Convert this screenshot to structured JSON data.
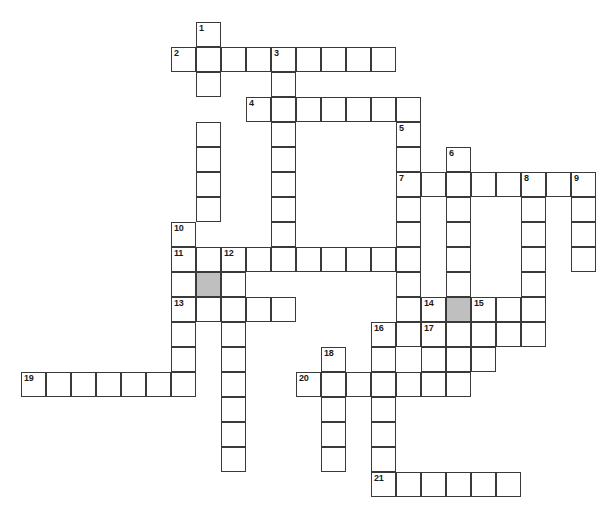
{
  "puzzle": {
    "kind": "crossword-grid",
    "title": "",
    "cell_size_px": 25,
    "grid_origin": {
      "x": 21,
      "y": 22
    },
    "canvas": {
      "width": 603,
      "height": 521
    },
    "colors": {
      "background": "#ffffff",
      "cell_fill": "#ffffff",
      "cell_border": "#3a3a3a",
      "shaded_fill": "#bfbfbf",
      "number_text": "#1a1a1a"
    },
    "counts": {
      "total_cells": 146,
      "numbered_cells": 21,
      "shaded_cells": 2
    },
    "entries": [
      {
        "number": "1",
        "direction": "down",
        "col": 7,
        "row": 0,
        "length": 7
      },
      {
        "number": "2",
        "direction": "across",
        "col": 6,
        "row": 1,
        "length": 9
      },
      {
        "number": "3",
        "direction": "down",
        "col": 10,
        "row": 1,
        "length": 9
      },
      {
        "number": "4",
        "direction": "across",
        "col": 9,
        "row": 3,
        "length": 7
      },
      {
        "number": "5",
        "direction": "down",
        "col": 15,
        "row": 4,
        "length": 8
      },
      {
        "number": "6",
        "direction": "down",
        "col": 17,
        "row": 5,
        "length": 10
      },
      {
        "number": "7",
        "direction": "across",
        "col": 15,
        "row": 6,
        "length": 8
      },
      {
        "number": "8",
        "direction": "down",
        "col": 20,
        "row": 6,
        "length": 7
      },
      {
        "number": "9",
        "direction": "down",
        "col": 22,
        "row": 6,
        "length": 5
      },
      {
        "number": "10",
        "direction": "down",
        "col": 6,
        "row": 8,
        "length": 8
      },
      {
        "number": "11",
        "direction": "across",
        "col": 6,
        "row": 9,
        "length": 10
      },
      {
        "number": "12",
        "direction": "down",
        "col": 8,
        "row": 9,
        "length": 9
      },
      {
        "number": "13",
        "direction": "across",
        "col": 6,
        "row": 11,
        "length": 5
      },
      {
        "number": "14",
        "direction": "across",
        "col": 16,
        "row": 11,
        "length": 5
      },
      {
        "number": "15",
        "direction": "down",
        "col": 18,
        "row": 11,
        "length": 4
      },
      {
        "number": "16",
        "direction": "down",
        "col": 14,
        "row": 12,
        "length": 8
      },
      {
        "number": "17",
        "direction": "across",
        "col": 16,
        "row": 12,
        "length": 5
      },
      {
        "number": "18",
        "direction": "down",
        "col": 12,
        "row": 13,
        "length": 7
      },
      {
        "number": "19",
        "direction": "across",
        "col": 0,
        "row": 14,
        "length": 7
      },
      {
        "number": "20",
        "direction": "across",
        "col": 11,
        "row": 14,
        "length": 7
      },
      {
        "number": "21",
        "direction": "across",
        "col": 14,
        "row": 18,
        "length": 6
      }
    ],
    "shaded_cells": [
      {
        "col": 7,
        "row": 10
      },
      {
        "col": 17,
        "row": 11
      }
    ],
    "cells": [
      {
        "col": 7,
        "row": 0,
        "num": "1"
      },
      {
        "col": 6,
        "row": 1,
        "num": "2"
      },
      {
        "col": 7,
        "row": 1,
        "num": ""
      },
      {
        "col": 8,
        "row": 1,
        "num": ""
      },
      {
        "col": 9,
        "row": 1,
        "num": ""
      },
      {
        "col": 10,
        "row": 1,
        "num": "3"
      },
      {
        "col": 11,
        "row": 1,
        "num": ""
      },
      {
        "col": 12,
        "row": 1,
        "num": ""
      },
      {
        "col": 13,
        "row": 1,
        "num": ""
      },
      {
        "col": 14,
        "row": 1,
        "num": ""
      },
      {
        "col": 7,
        "row": 2,
        "num": ""
      },
      {
        "col": 10,
        "row": 2,
        "num": ""
      },
      {
        "col": 9,
        "row": 3,
        "num": "4"
      },
      {
        "col": 10,
        "row": 3,
        "num": ""
      },
      {
        "col": 11,
        "row": 3,
        "num": ""
      },
      {
        "col": 12,
        "row": 3,
        "num": ""
      },
      {
        "col": 13,
        "row": 3,
        "num": ""
      },
      {
        "col": 14,
        "row": 3,
        "num": ""
      },
      {
        "col": 15,
        "row": 3,
        "num": ""
      },
      {
        "col": 7,
        "row": 4,
        "num": ""
      },
      {
        "col": 10,
        "row": 4,
        "num": ""
      },
      {
        "col": 15,
        "row": 4,
        "num": "5"
      },
      {
        "col": 7,
        "row": 5,
        "num": ""
      },
      {
        "col": 10,
        "row": 5,
        "num": ""
      },
      {
        "col": 15,
        "row": 5,
        "num": ""
      },
      {
        "col": 17,
        "row": 5,
        "num": "6"
      },
      {
        "col": 7,
        "row": 6,
        "num": ""
      },
      {
        "col": 10,
        "row": 6,
        "num": ""
      },
      {
        "col": 15,
        "row": 6,
        "num": "7"
      },
      {
        "col": 16,
        "row": 6,
        "num": ""
      },
      {
        "col": 17,
        "row": 6,
        "num": ""
      },
      {
        "col": 18,
        "row": 6,
        "num": ""
      },
      {
        "col": 19,
        "row": 6,
        "num": ""
      },
      {
        "col": 20,
        "row": 6,
        "num": "8"
      },
      {
        "col": 21,
        "row": 6,
        "num": ""
      },
      {
        "col": 22,
        "row": 6,
        "num": "9"
      },
      {
        "col": 7,
        "row": 7,
        "num": ""
      },
      {
        "col": 10,
        "row": 7,
        "num": ""
      },
      {
        "col": 15,
        "row": 7,
        "num": ""
      },
      {
        "col": 17,
        "row": 7,
        "num": ""
      },
      {
        "col": 20,
        "row": 7,
        "num": ""
      },
      {
        "col": 22,
        "row": 7,
        "num": ""
      },
      {
        "col": 6,
        "row": 8,
        "num": "10"
      },
      {
        "col": 10,
        "row": 8,
        "num": ""
      },
      {
        "col": 15,
        "row": 8,
        "num": ""
      },
      {
        "col": 17,
        "row": 8,
        "num": ""
      },
      {
        "col": 20,
        "row": 8,
        "num": ""
      },
      {
        "col": 22,
        "row": 8,
        "num": ""
      },
      {
        "col": 6,
        "row": 9,
        "num": "11"
      },
      {
        "col": 7,
        "row": 9,
        "num": ""
      },
      {
        "col": 8,
        "row": 9,
        "num": "12"
      },
      {
        "col": 9,
        "row": 9,
        "num": ""
      },
      {
        "col": 10,
        "row": 9,
        "num": ""
      },
      {
        "col": 11,
        "row": 9,
        "num": ""
      },
      {
        "col": 12,
        "row": 9,
        "num": ""
      },
      {
        "col": 13,
        "row": 9,
        "num": ""
      },
      {
        "col": 14,
        "row": 9,
        "num": ""
      },
      {
        "col": 15,
        "row": 9,
        "num": ""
      },
      {
        "col": 17,
        "row": 9,
        "num": ""
      },
      {
        "col": 20,
        "row": 9,
        "num": ""
      },
      {
        "col": 22,
        "row": 9,
        "num": ""
      },
      {
        "col": 6,
        "row": 10,
        "num": ""
      },
      {
        "col": 7,
        "row": 10,
        "num": ""
      },
      {
        "col": 8,
        "row": 10,
        "num": ""
      },
      {
        "col": 15,
        "row": 10,
        "num": ""
      },
      {
        "col": 17,
        "row": 10,
        "num": ""
      },
      {
        "col": 20,
        "row": 10,
        "num": ""
      },
      {
        "col": 6,
        "row": 11,
        "num": "13"
      },
      {
        "col": 7,
        "row": 11,
        "num": ""
      },
      {
        "col": 8,
        "row": 11,
        "num": ""
      },
      {
        "col": 9,
        "row": 11,
        "num": ""
      },
      {
        "col": 10,
        "row": 11,
        "num": ""
      },
      {
        "col": 15,
        "row": 11,
        "num": ""
      },
      {
        "col": 16,
        "row": 11,
        "num": "14"
      },
      {
        "col": 17,
        "row": 11,
        "num": ""
      },
      {
        "col": 18,
        "row": 11,
        "num": "15"
      },
      {
        "col": 19,
        "row": 11,
        "num": ""
      },
      {
        "col": 20,
        "row": 11,
        "num": ""
      },
      {
        "col": 6,
        "row": 12,
        "num": ""
      },
      {
        "col": 8,
        "row": 12,
        "num": ""
      },
      {
        "col": 14,
        "row": 12,
        "num": "16"
      },
      {
        "col": 15,
        "row": 12,
        "num": ""
      },
      {
        "col": 16,
        "row": 12,
        "num": "17"
      },
      {
        "col": 17,
        "row": 12,
        "num": ""
      },
      {
        "col": 18,
        "row": 12,
        "num": ""
      },
      {
        "col": 19,
        "row": 12,
        "num": ""
      },
      {
        "col": 20,
        "row": 12,
        "num": ""
      },
      {
        "col": 6,
        "row": 13,
        "num": ""
      },
      {
        "col": 8,
        "row": 13,
        "num": ""
      },
      {
        "col": 12,
        "row": 13,
        "num": "18"
      },
      {
        "col": 14,
        "row": 13,
        "num": ""
      },
      {
        "col": 16,
        "row": 13,
        "num": ""
      },
      {
        "col": 17,
        "row": 13,
        "num": ""
      },
      {
        "col": 18,
        "row": 13,
        "num": ""
      },
      {
        "col": 0,
        "row": 14,
        "num": "19"
      },
      {
        "col": 1,
        "row": 14,
        "num": ""
      },
      {
        "col": 2,
        "row": 14,
        "num": ""
      },
      {
        "col": 3,
        "row": 14,
        "num": ""
      },
      {
        "col": 4,
        "row": 14,
        "num": ""
      },
      {
        "col": 5,
        "row": 14,
        "num": ""
      },
      {
        "col": 6,
        "row": 14,
        "num": ""
      },
      {
        "col": 8,
        "row": 14,
        "num": ""
      },
      {
        "col": 11,
        "row": 14,
        "num": "20"
      },
      {
        "col": 12,
        "row": 14,
        "num": ""
      },
      {
        "col": 13,
        "row": 14,
        "num": ""
      },
      {
        "col": 14,
        "row": 14,
        "num": ""
      },
      {
        "col": 15,
        "row": 14,
        "num": ""
      },
      {
        "col": 16,
        "row": 14,
        "num": ""
      },
      {
        "col": 17,
        "row": 14,
        "num": ""
      },
      {
        "col": 8,
        "row": 15,
        "num": ""
      },
      {
        "col": 12,
        "row": 15,
        "num": ""
      },
      {
        "col": 14,
        "row": 15,
        "num": ""
      },
      {
        "col": 8,
        "row": 16,
        "num": ""
      },
      {
        "col": 12,
        "row": 16,
        "num": ""
      },
      {
        "col": 14,
        "row": 16,
        "num": ""
      },
      {
        "col": 8,
        "row": 17,
        "num": ""
      },
      {
        "col": 12,
        "row": 17,
        "num": ""
      },
      {
        "col": 14,
        "row": 17,
        "num": ""
      },
      {
        "col": 14,
        "row": 18,
        "num": "21"
      },
      {
        "col": 15,
        "row": 18,
        "num": ""
      },
      {
        "col": 16,
        "row": 18,
        "num": ""
      },
      {
        "col": 17,
        "row": 18,
        "num": ""
      },
      {
        "col": 18,
        "row": 18,
        "num": ""
      },
      {
        "col": 19,
        "row": 18,
        "num": ""
      }
    ]
  }
}
